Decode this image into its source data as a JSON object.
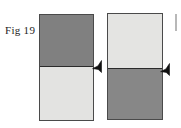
{
  "figure": {
    "label": "Fig 19",
    "background_color": "#ffffff",
    "width": 181,
    "height": 128
  },
  "specimens": [
    {
      "id": "specimen-a",
      "name": "left-specimen",
      "top_band_color": "#808080",
      "bottom_band_color": "#e3e3e1",
      "border_color": "#4a4a4a",
      "divider_color": "#2b2b2b"
    },
    {
      "id": "specimen-b",
      "name": "right-specimen",
      "top_band_color": "#e4e4e2",
      "bottom_band_color": "#878787",
      "border_color": "#4a4a4a",
      "divider_color": "#2b2b2b"
    }
  ],
  "markers": [
    {
      "id": "marker-a",
      "name": "interface-arrow-left",
      "color": "#111111"
    },
    {
      "id": "marker-b",
      "name": "interface-arrow-right",
      "color": "#111111"
    }
  ],
  "neighbor_edge": {
    "color": "#b8b8b8"
  }
}
